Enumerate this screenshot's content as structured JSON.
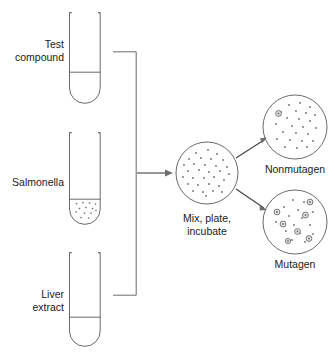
{
  "diagram": {
    "labels": {
      "test_compound_line1": "Test",
      "test_compound_line2": "compound",
      "salmonella": "Salmonella",
      "liver_extract_line1": "Liver",
      "liver_extract_line2": "extract",
      "mix_plate_line1": "Mix, plate,",
      "mix_plate_line2": "incubate",
      "nonmutagen": "Nonmutagen",
      "mutagen": "Mutagen"
    },
    "colors": {
      "stroke": "#58595b",
      "arrow": "#414042",
      "dot": "#6d6e71",
      "colony_fill": "#e8e8ea",
      "background": "#ffffff",
      "text": "#1a1a1a"
    },
    "tubes": [
      {
        "name": "test-compound-tube",
        "label": "Test compound",
        "x": 69,
        "y_top": 12,
        "width": 31,
        "y_bottom": 103,
        "liquid_level_y": 72,
        "contents": "clear liquid",
        "dot_count": 0
      },
      {
        "name": "salmonella-tube",
        "label": "Salmonella",
        "x": 69,
        "y_top": 132,
        "width": 31,
        "y_bottom": 224,
        "liquid_level_y": 199,
        "contents": "bacterial suspension",
        "dot_count": 13
      },
      {
        "name": "liver-extract-tube",
        "label": "Liver extract",
        "x": 69,
        "y_top": 252,
        "width": 31,
        "y_bottom": 346,
        "liquid_level_y": 317,
        "contents": "clear liquid",
        "dot_count": 0
      }
    ],
    "connector": {
      "name": "manifold",
      "vertical_x": 136,
      "top_y": 52,
      "bottom_y": 295,
      "stub_start_x": 113,
      "outlet_y": 173
    },
    "arrows": [
      {
        "name": "mix-arrow",
        "x1": 137,
        "y1": 173,
        "x2": 171,
        "y2": 173
      },
      {
        "name": "nonmutagen-arrow",
        "x1": 236,
        "y1": 158,
        "x2": 265,
        "y2": 139
      },
      {
        "name": "mutagen-arrow",
        "x1": 236,
        "y1": 189,
        "x2": 265,
        "y2": 209
      }
    ],
    "plates": [
      {
        "name": "mix-plate",
        "label": "Mix, plate, incubate",
        "cx": 207,
        "cy": 173,
        "r": 31,
        "small_dots": 31,
        "large_colonies": 0
      },
      {
        "name": "nonmutagen-plate",
        "label": "Nonmutagen",
        "cx": 295,
        "cy": 127,
        "r": 32,
        "small_dots": 24,
        "large_colonies": 1
      },
      {
        "name": "mutagen-plate",
        "label": "Mutagen",
        "cx": 295,
        "cy": 222,
        "r": 32,
        "small_dots": 15,
        "large_colonies": 7
      }
    ]
  }
}
